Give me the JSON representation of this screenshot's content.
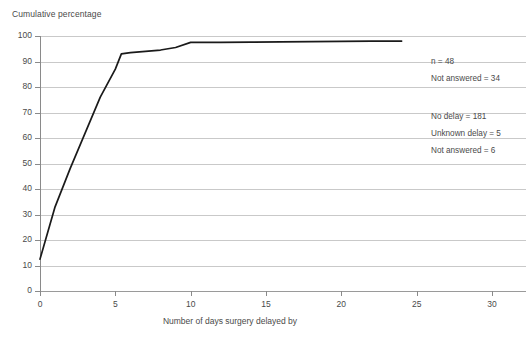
{
  "chart_data": {
    "type": "line",
    "title": "",
    "ylabel": "Cumulative percentage",
    "xlabel": "Number of days surgery delayed by",
    "xlim": [
      0,
      30
    ],
    "ylim": [
      0,
      100
    ],
    "grid": true,
    "legend_position": "none",
    "x_ticks": [
      "0",
      "5",
      "10",
      "15",
      "20",
      "25",
      "30"
    ],
    "y_ticks": [
      "0",
      "10",
      "20",
      "30",
      "40",
      "50",
      "60",
      "70",
      "80",
      "90",
      "100"
    ],
    "series": [
      {
        "name": "Cumulative percentage of patients",
        "color": "#1a1a1a",
        "x": [
          0,
          1,
          2,
          3,
          4,
          5,
          5.4,
          6,
          7,
          8,
          9,
          10,
          12,
          14,
          16,
          18,
          20,
          22,
          24
        ],
        "values": [
          12.5,
          33,
          48,
          62,
          76,
          87,
          93,
          93.5,
          94,
          94.5,
          95.5,
          97.5,
          97.5,
          97.6,
          97.7,
          97.8,
          97.9,
          98,
          98
        ]
      }
    ]
  },
  "annotations": [
    {
      "text": "n = 48",
      "top": 57
    },
    {
      "text": "Not answered = 34",
      "top": 74
    },
    {
      "text": "No delay = 181",
      "top": 112
    },
    {
      "text": "Unknown delay = 5",
      "top": 129
    },
    {
      "text": "Not answered = 6",
      "top": 146
    }
  ],
  "caption": ""
}
